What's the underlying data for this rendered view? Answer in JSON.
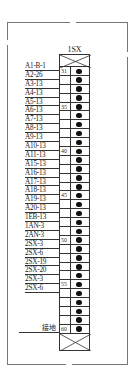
{
  "terminal_block": {
    "title": "1SX",
    "start_number": 31,
    "end_number": 60,
    "marked_numbers": [
      "31",
      "35",
      "40",
      "45",
      "50",
      "55",
      "60"
    ]
  },
  "wires": [
    {
      "terminal": 31,
      "label": "A1-B-1"
    },
    {
      "terminal": 32,
      "label": "A2-26"
    },
    {
      "terminal": 33,
      "label": "A3-13"
    },
    {
      "terminal": 34,
      "label": "A4-13"
    },
    {
      "terminal": 35,
      "label": "A5-13"
    },
    {
      "terminal": 36,
      "label": "A6-13"
    },
    {
      "terminal": 37,
      "label": "A7-13"
    },
    {
      "terminal": 38,
      "label": "A8-13"
    },
    {
      "terminal": 39,
      "label": "A9-13"
    },
    {
      "terminal": 40,
      "label": "A10-13"
    },
    {
      "terminal": 41,
      "label": "A11-13"
    },
    {
      "terminal": 42,
      "label": "A15-13"
    },
    {
      "terminal": 43,
      "label": "A16-13"
    },
    {
      "terminal": 44,
      "label": "A17-13"
    },
    {
      "terminal": 45,
      "label": "A18-13"
    },
    {
      "terminal": 46,
      "label": "A19-13"
    },
    {
      "terminal": 47,
      "label": "A20-13"
    },
    {
      "terminal": 48,
      "label": "1EB-13"
    },
    {
      "terminal": 49,
      "label": "1AN-3"
    },
    {
      "terminal": 50,
      "label": "2AN-3"
    },
    {
      "terminal": 51,
      "label": "2SX-3"
    },
    {
      "terminal": 52,
      "label": "2SX-6"
    },
    {
      "terminal": 53,
      "label": "2SX-19"
    },
    {
      "terminal": 54,
      "label": "2SX-20"
    },
    {
      "terminal": 55,
      "label": "2SX-3"
    },
    {
      "terminal": 56,
      "label": "2SX-6"
    }
  ],
  "ground": {
    "terminal": 60,
    "label": "接地"
  }
}
